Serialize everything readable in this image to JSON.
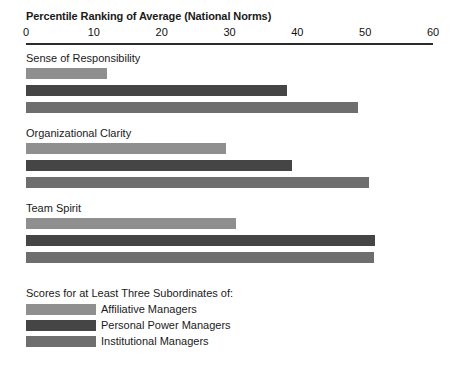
{
  "chart_data": {
    "type": "bar",
    "orientation": "horizontal",
    "title": "Percentile Ranking of Average (National Norms)",
    "xlabel": "",
    "ylabel": "",
    "xlim": [
      0,
      60
    ],
    "ticks": [
      0,
      10,
      20,
      30,
      40,
      50,
      60
    ],
    "tick_labels": [
      "0",
      "10",
      "20",
      "30",
      "40",
      "50",
      "60"
    ],
    "grid": false,
    "legend_position": "bottom-left",
    "legend_title": "Scores for at Least Three Subordinates of:",
    "categories": [
      "Sense of Responsibility",
      "Organizational Clarity",
      "Team Spirit"
    ],
    "series": [
      {
        "name": "Affiliative Managers",
        "color": "#8f8f8f",
        "values": [
          12,
          29.5,
          31
        ]
      },
      {
        "name": "Personal Power Managers",
        "color": "#454545",
        "values": [
          38.5,
          39.2,
          51.5
        ]
      },
      {
        "name": "Institutional Managers",
        "color": "#6e6e6e",
        "values": [
          49,
          50.5,
          51.3
        ]
      }
    ]
  }
}
